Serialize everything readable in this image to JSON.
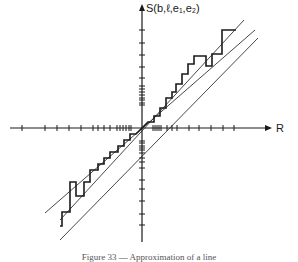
{
  "figure": {
    "y_axis_label": "S(b,ℓ,e₁,e₂)",
    "x_axis_label": "R",
    "caption": "Figure 33 — Approximation of a line",
    "colors": {
      "ink": "#1a1a1a",
      "bound_lines": "#333333",
      "background": "#ffffff"
    }
  },
  "axes": {
    "origin": [
      142,
      128
    ],
    "x_axis": {
      "from": 10,
      "to": 272
    },
    "y_axis": {
      "from": 242,
      "to": 4
    },
    "x_ticks": [
      22,
      45,
      57,
      69,
      81,
      93,
      98,
      104,
      110,
      117,
      120,
      123,
      126,
      129,
      131,
      153,
      155,
      157,
      159,
      161,
      167,
      172,
      177,
      189,
      199,
      211,
      223,
      234
    ],
    "y_ticks": [
      30,
      43,
      55,
      67,
      78,
      86,
      89,
      92,
      95,
      98,
      100,
      103,
      105,
      141,
      143,
      146,
      148,
      150,
      153,
      158,
      162,
      168,
      180,
      189,
      201,
      214,
      225
    ]
  },
  "lines": [
    {
      "name": "upper-bound-line",
      "x1": 60,
      "y1": 220,
      "x2": 244,
      "y2": 20
    },
    {
      "name": "middle-line",
      "x1": 45,
      "y1": 213,
      "x2": 255,
      "y2": 30
    },
    {
      "name": "lower-bound-line",
      "x1": 60,
      "y1": 240,
      "x2": 258,
      "y2": 38
    }
  ],
  "staircase_upper": [
    [
      142,
      128
    ],
    [
      148,
      122
    ],
    [
      154,
      122
    ],
    [
      154,
      116
    ],
    [
      160,
      116
    ],
    [
      160,
      108
    ],
    [
      166,
      108
    ],
    [
      166,
      98
    ],
    [
      172,
      98
    ],
    [
      172,
      92
    ],
    [
      176,
      92
    ],
    [
      176,
      84
    ],
    [
      182,
      84
    ],
    [
      182,
      74
    ],
    [
      188,
      74
    ],
    [
      188,
      64
    ],
    [
      194,
      64
    ],
    [
      194,
      56
    ],
    [
      206,
      56
    ],
    [
      206,
      66
    ],
    [
      212,
      66
    ],
    [
      212,
      54
    ],
    [
      222,
      54
    ],
    [
      222,
      30
    ],
    [
      236,
      30
    ]
  ],
  "staircase_lower": [
    [
      142,
      128
    ],
    [
      136,
      134
    ],
    [
      130,
      134
    ],
    [
      130,
      140
    ],
    [
      124,
      140
    ],
    [
      124,
      146
    ],
    [
      118,
      146
    ],
    [
      118,
      152
    ],
    [
      110,
      152
    ],
    [
      110,
      158
    ],
    [
      104,
      158
    ],
    [
      104,
      164
    ],
    [
      98,
      164
    ],
    [
      98,
      170
    ],
    [
      90,
      170
    ],
    [
      90,
      182
    ],
    [
      84,
      182
    ],
    [
      84,
      196
    ],
    [
      76,
      196
    ],
    [
      76,
      182
    ],
    [
      70,
      182
    ],
    [
      70,
      212
    ],
    [
      62,
      212
    ],
    [
      62,
      226
    ],
    [
      60,
      226
    ]
  ]
}
